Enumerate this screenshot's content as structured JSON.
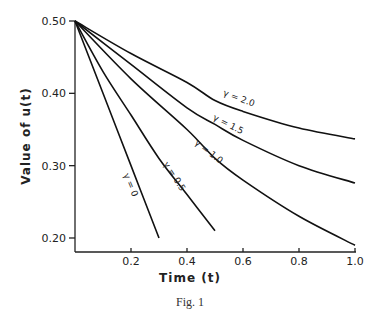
{
  "figure": {
    "caption": "Fig. 1"
  },
  "chart_data": {
    "type": "line",
    "title": "",
    "xlabel": "Time (t)",
    "ylabel": "Value of u(t)",
    "xlim": [
      0,
      1.0
    ],
    "ylim": [
      0.18,
      0.5
    ],
    "grid": false,
    "legend": "inline labels on curves",
    "x_ticks": [
      0.2,
      0.4,
      0.6,
      0.8,
      1.0
    ],
    "x_tick_labels": [
      "0.2",
      "0.4",
      "0.6",
      "0.8",
      "1.0"
    ],
    "y_ticks": [
      0.2,
      0.3,
      0.4,
      0.5
    ],
    "y_tick_labels": [
      "0.20",
      "0.30",
      "0.40",
      "0.50"
    ],
    "series": [
      {
        "name": "γ = 0",
        "label": "γ = 0",
        "x": [
          0,
          0.1,
          0.2,
          0.3
        ],
        "y": [
          0.5,
          0.4,
          0.3,
          0.2
        ]
      },
      {
        "name": "γ = 0.5",
        "label": "γ = 0.5",
        "x": [
          0,
          0.1,
          0.2,
          0.3,
          0.4,
          0.5
        ],
        "y": [
          0.5,
          0.43,
          0.37,
          0.31,
          0.26,
          0.21
        ]
      },
      {
        "name": "γ = 1.0",
        "label": "γ = 1.0",
        "x": [
          0,
          0.2,
          0.4,
          0.5,
          0.6,
          0.8,
          1.0
        ],
        "y": [
          0.5,
          0.42,
          0.35,
          0.31,
          0.28,
          0.23,
          0.19
        ]
      },
      {
        "name": "γ = 1.5",
        "label": "γ = 1.5",
        "x": [
          0,
          0.2,
          0.4,
          0.5,
          0.6,
          0.8,
          1.0
        ],
        "y": [
          0.5,
          0.44,
          0.38,
          0.357,
          0.335,
          0.3,
          0.276
        ]
      },
      {
        "name": "γ = 2.0",
        "label": "γ = 2.0",
        "x": [
          0,
          0.2,
          0.4,
          0.5,
          0.6,
          0.8,
          1.0
        ],
        "y": [
          0.5,
          0.455,
          0.415,
          0.39,
          0.375,
          0.352,
          0.337
        ]
      }
    ]
  }
}
